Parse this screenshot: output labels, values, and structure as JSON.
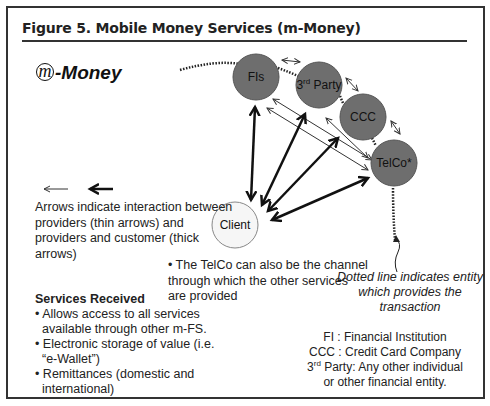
{
  "figure": {
    "title": "Figure 5.  Mobile Money Services (m-Money)",
    "logo": {
      "icon": "m-circle-icon",
      "symbol": "m",
      "text": "-Money"
    }
  },
  "nodes": {
    "fis": {
      "label": "FIs",
      "fill": "#6e6e6e"
    },
    "third_party": {
      "label_base": "3",
      "label_sup": "rd",
      "label_rest": " Party",
      "fill": "#6e6e6e"
    },
    "ccc": {
      "label": "CCC",
      "fill": "#6e6e6e"
    },
    "telco": {
      "label": "TelCo*",
      "fill": "#6e6e6e"
    },
    "client": {
      "label": "Client",
      "fill": "#f4f4f4"
    }
  },
  "legend": {
    "thin_arrow": "thin-arrow-icon",
    "thick_arrow": "thick-arrow-icon",
    "text": "Arrows indicate interaction between providers (thin arrows) and providers and customer (thick arrows)"
  },
  "telco_note": "• The TelCo can also be the channel through which the other services are provided",
  "dotted_note": "Dotted line indicates entity which provides the transaction",
  "services": {
    "heading": "Services Received",
    "items": [
      "• Allows access to all services available through other m-FS.",
      "• Electronic storage of value (i.e. “e-Wallet”)",
      "• Remittances (domestic and international)"
    ]
  },
  "abbreviations": {
    "fi": "FI : Financial Institution",
    "ccc": "CCC : Credit Card Company",
    "third_base": "3",
    "third_sup": "rd",
    "third_rest": " Party: Any other individual",
    "third_cont": "or other financial entity."
  }
}
